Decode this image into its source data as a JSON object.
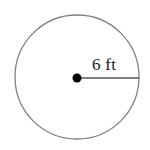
{
  "figure": {
    "kind": "circle-radius-diagram",
    "background_color": "#ffffff",
    "stroke_color": "#808080",
    "center_dot_color": "#000000",
    "radius_line_color": "#555555",
    "label_color": "#1a1a1a",
    "radius_label": "6 ft",
    "measurement": {
      "value": "6",
      "unit": "ft",
      "quantity": "radius"
    },
    "geometry": {
      "center_x": 77,
      "center_y": 77,
      "radius_px": 62,
      "radius_line_start_x": 77,
      "radius_line_start_y": 78,
      "radius_line_end_x": 139,
      "radius_line_end_y": 78,
      "center_dot_radius_px": 4.5
    }
  }
}
